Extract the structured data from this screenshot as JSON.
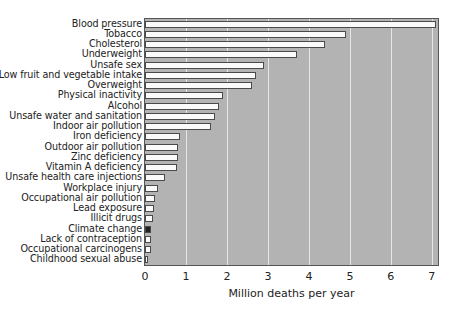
{
  "chart_data": {
    "type": "bar",
    "orientation": "horizontal",
    "title": "",
    "xlabel": "Million deaths per year",
    "ylabel": "",
    "xlim": [
      0,
      7.15
    ],
    "xticks": [
      0,
      1,
      2,
      3,
      4,
      5,
      6,
      7
    ],
    "grid": "vertical",
    "legend": null,
    "categories": [
      "Blood pressure",
      "Tobacco",
      "Cholesterol",
      "Underweight",
      "Unsafe sex",
      "Low fruit and vegetable intake",
      "Overweight",
      "Physical inactivity",
      "Alcohol",
      "Unsafe water and sanitation",
      "Indoor air pollution",
      "Iron deficiency",
      "Outdoor air pollution",
      "Zinc deficiency",
      "Vitamin A deficiency",
      "Unsafe health care injections",
      "Workplace injury",
      "Occupational air pollution",
      "Lead exposure",
      "Illicit drugs",
      "Climate change",
      "Lack of contraception",
      "Occupational carcinogens",
      "Childhood sexual abuse"
    ],
    "values": [
      7.1,
      4.9,
      4.4,
      3.7,
      2.9,
      2.7,
      2.6,
      1.9,
      1.8,
      1.7,
      1.6,
      0.85,
      0.8,
      0.8,
      0.78,
      0.5,
      0.31,
      0.24,
      0.23,
      0.2,
      0.15,
      0.15,
      0.15,
      0.08
    ],
    "highlight": "Climate change",
    "colors": {
      "bar_fill": "#fafafa",
      "bar_border": "#4a4a4a",
      "highlight_fill": "#222222",
      "plot_background": "#b3b3b3",
      "gridline": "#e6e6e6"
    }
  }
}
